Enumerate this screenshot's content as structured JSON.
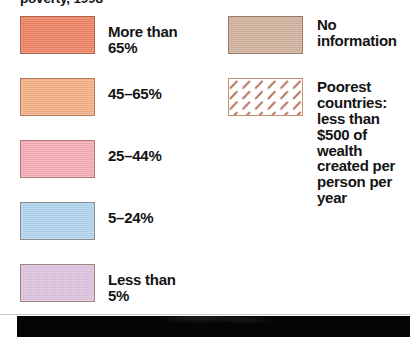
{
  "legend": {
    "title": "poverty, 1998",
    "left_column": [
      {
        "label": "More than 65%",
        "color": "#ef7f5f",
        "swatch_name": "swatch-more-than-65",
        "top": 0
      },
      {
        "label": "45–65%",
        "color": "#f5ad82",
        "swatch_name": "swatch-45-65",
        "top": 62
      },
      {
        "label": "25–44%",
        "color": "#f6a9b3",
        "swatch_name": "swatch-25-44",
        "top": 124
      },
      {
        "label": "5–24%",
        "color": "#aed4ef",
        "swatch_name": "swatch-5-24",
        "top": 186
      },
      {
        "label": "Less than 5%",
        "color": "#dcc3df",
        "swatch_name": "swatch-less-than-5",
        "top": 248
      }
    ],
    "right_column": [
      {
        "label": "No\ninformation",
        "color": "#cfb09a",
        "swatch_name": "swatch-no-information",
        "pattern": "solid",
        "top": 0
      },
      {
        "label": "Poorest\ncountries:\nless than\n$500 of\nwealth\ncreated per\nperson per\nyear",
        "color": "#ffffff",
        "hatch_color": "#b5705a",
        "swatch_name": "swatch-poorest-countries",
        "pattern": "diagonal-dash-hatch",
        "top": 62
      }
    ]
  },
  "footer": {
    "band_color": "#050505"
  }
}
